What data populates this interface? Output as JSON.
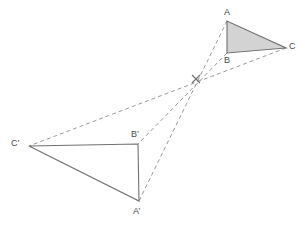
{
  "figure": {
    "name": "homothety-two-triangles",
    "canvas": {
      "width": 301,
      "height": 228
    },
    "background_color": "#ffffff"
  },
  "style": {
    "solid_stroke_color": "#707070",
    "solid_stroke_width": 1.1,
    "dashed_stroke_color": "#9a9a9a",
    "dashed_stroke_width": 1.0,
    "dash_pattern": "4,3",
    "shaded_fill_color": "#d3d3d3",
    "label_color": "#4a4a4a",
    "label_font_size": 9,
    "center_marker_color": "#6e6e6e"
  },
  "center": {
    "name": "center-of-homothety",
    "x": 196,
    "y": 79,
    "marker": "cross-tick",
    "label": ""
  },
  "triangles": [
    {
      "name": "triangle-abc",
      "filled": true,
      "vertices": [
        {
          "name": "vertex-a",
          "label": "A",
          "x": 227,
          "y": 21,
          "label_x": 224,
          "label_y": 8
        },
        {
          "name": "vertex-b",
          "label": "B",
          "x": 227,
          "y": 53,
          "label_x": 224,
          "label_y": 56
        },
        {
          "name": "vertex-c",
          "label": "C",
          "x": 286,
          "y": 48,
          "label_x": 289,
          "label_y": 42
        }
      ]
    },
    {
      "name": "triangle-a-prime-b-prime-c-prime",
      "filled": false,
      "vertices": [
        {
          "name": "vertex-a-prime",
          "label": "A’",
          "x": 139,
          "y": 201,
          "label_x": 133,
          "label_y": 207
        },
        {
          "name": "vertex-b-prime",
          "label": "B’",
          "x": 138,
          "y": 144,
          "label_x": 131,
          "label_y": 130
        },
        {
          "name": "vertex-c-prime",
          "label": "C’",
          "x": 29,
          "y": 146,
          "label_x": 11,
          "label_y": 139
        }
      ]
    }
  ],
  "projection_rays": [
    {
      "name": "ray-a-to-a-prime",
      "from_label": "A",
      "to_label": "A’",
      "x1": 227,
      "y1": 21,
      "x2": 139,
      "y2": 201
    },
    {
      "name": "ray-b-to-b-prime",
      "from_label": "B",
      "to_label": "B’",
      "x1": 227,
      "y1": 53,
      "x2": 138,
      "y2": 144
    },
    {
      "name": "ray-c-to-c-prime",
      "from_label": "C",
      "to_label": "C’",
      "x1": 286,
      "y1": 48,
      "x2": 29,
      "y2": 146
    }
  ]
}
